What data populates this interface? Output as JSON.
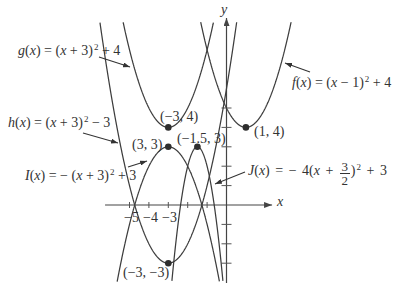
{
  "chart_data": {
    "type": "line",
    "title": "",
    "xlabel": "x",
    "ylabel": "y",
    "x_ticks": [
      -5,
      -4,
      -3,
      -2,
      -1
    ],
    "x_tick_labels": [
      "−5",
      "−4",
      "−3"
    ],
    "y_ticks": [
      -3,
      -2,
      -1,
      1,
      2,
      3,
      4,
      5
    ],
    "axis_range": {
      "x": [
        -6.26,
        2.35
      ],
      "y": [
        -4.02,
        9.64
      ]
    },
    "xlim": [
      -7,
      4
    ],
    "curve_clip": [
      -3.95,
      9.43
    ],
    "grid": false,
    "legend": "inline labels with arrows",
    "series": [
      {
        "id": "g",
        "name": "g(x)",
        "equation": "g(x) = (x + 3)^2 + 4",
        "a": 1,
        "h": -3,
        "k": 4,
        "vertex": [
          -3,
          4
        ],
        "label_segments": [
          {
            "t": "g",
            "i": true
          },
          {
            "t": "("
          },
          {
            "t": "x",
            "i": true
          },
          {
            "t": ") = ("
          },
          {
            "t": "x",
            "i": true
          },
          {
            "t": " + 3)"
          },
          {
            "t": "2",
            "sup": true
          },
          {
            "t": " + 4"
          }
        ]
      },
      {
        "id": "f",
        "name": "f(x)",
        "equation": "f(x) = (x − 1)^2 + 4",
        "a": 1,
        "h": 1,
        "k": 4,
        "vertex": [
          1,
          4
        ],
        "label_segments": [
          {
            "t": "f",
            "i": true
          },
          {
            "t": "("
          },
          {
            "t": "x",
            "i": true
          },
          {
            "t": ") = ("
          },
          {
            "t": "x",
            "i": true
          },
          {
            "t": " − 1)"
          },
          {
            "t": "2",
            "sup": true
          },
          {
            "t": " + 4"
          }
        ]
      },
      {
        "id": "h",
        "name": "h(x)",
        "equation": "h(x) = (x + 3)^2 − 3",
        "a": 1,
        "h": -3,
        "k": -3,
        "vertex": [
          -3,
          -3
        ],
        "label_segments": [
          {
            "t": "h",
            "i": true
          },
          {
            "t": "("
          },
          {
            "t": "x",
            "i": true
          },
          {
            "t": ") = ("
          },
          {
            "t": "x",
            "i": true
          },
          {
            "t": " + 3)"
          },
          {
            "t": "2",
            "sup": true
          },
          {
            "t": " − 3"
          }
        ]
      },
      {
        "id": "I",
        "name": "I(x)",
        "equation": "I(x) = − (x + 3)^2 + 3",
        "a": -1,
        "h": -3,
        "k": 3,
        "vertex": [
          -3,
          3
        ],
        "label_segments": [
          {
            "t": "I",
            "i": true
          },
          {
            "t": "("
          },
          {
            "t": "x",
            "i": true
          },
          {
            "t": ") = − ("
          },
          {
            "t": "x",
            "i": true
          },
          {
            "t": " + 3)"
          },
          {
            "t": "2",
            "sup": true
          },
          {
            "t": " + 3"
          }
        ]
      },
      {
        "id": "J",
        "name": "J(x)",
        "equation": "J(x) = − 4(x + 3/2)^2 + 3",
        "a": -4,
        "h": -1.5,
        "k": 3,
        "vertex": [
          -1.5,
          3
        ],
        "label_segments": [
          {
            "t": "J",
            "i": true
          },
          {
            "t": "("
          },
          {
            "t": "x",
            "i": true
          },
          {
            "t": ") = − 4("
          },
          {
            "t": "x",
            "i": true
          },
          {
            "t": " + "
          },
          {
            "num": "3",
            "den": "2"
          },
          {
            "t": ")"
          },
          {
            "t": "2",
            "sup": true
          },
          {
            "t": " + 3"
          }
        ]
      }
    ],
    "points": [
      {
        "x": -3,
        "y": 4,
        "label": "(−3, 4)"
      },
      {
        "x": 1,
        "y": 4,
        "label": "(1, 4)"
      },
      {
        "x": -3,
        "y": 3,
        "label": "(3, 3)"
      },
      {
        "x": -1.5,
        "y": 3,
        "label": "(−1.5, 3)"
      },
      {
        "x": -3,
        "y": -3,
        "label": "(−3, −3)"
      }
    ]
  }
}
